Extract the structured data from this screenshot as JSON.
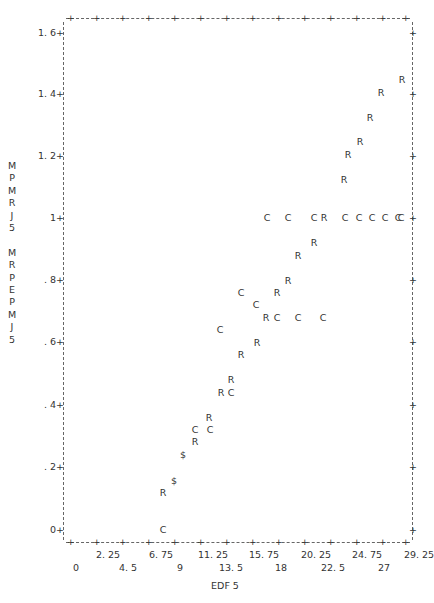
{
  "chart_data": {
    "type": "scatter",
    "title": "",
    "xlabel": "EDF 5",
    "ylabel": "MPMRJ5 MRPEPMJ5",
    "ylabel_lines": [
      "M",
      "P",
      "M",
      "R",
      "J",
      "5",
      "",
      "M",
      "R",
      "P",
      "E",
      "P",
      "M",
      "J",
      "5"
    ],
    "xlim": [
      0,
      29.25
    ],
    "ylim": [
      0,
      1.6
    ],
    "grid": false,
    "legend": null,
    "x_ticks_upper": [
      "2.25",
      "6.75",
      "11.25",
      "15.75",
      "20.25",
      "24.75",
      "29.25"
    ],
    "x_ticks_lower": [
      "0",
      "4.5",
      "9",
      "13.5",
      "18",
      "22.5",
      "27"
    ],
    "y_ticks": [
      "0+",
      ".2+",
      ".4+",
      ".6+",
      ".8+",
      "1+",
      "1.2+",
      "1.4+",
      "1.6+"
    ],
    "series": [
      {
        "name": "R",
        "symbol": "R",
        "points": [
          [
            29.0,
            1.45
          ],
          [
            27.2,
            1.41
          ],
          [
            26.2,
            1.33
          ],
          [
            25.4,
            1.25
          ],
          [
            24.3,
            1.21
          ],
          [
            23.9,
            1.13
          ],
          [
            19.7,
            1.0
          ],
          [
            21.2,
            0.92
          ],
          [
            19.9,
            0.88
          ],
          [
            18.9,
            0.8
          ],
          [
            17.9,
            0.76
          ],
          [
            17.1,
            0.68
          ],
          [
            16.3,
            0.6
          ],
          [
            14.9,
            0.56
          ],
          [
            14.0,
            0.48
          ],
          [
            13.2,
            0.44
          ],
          [
            12.1,
            0.36
          ],
          [
            11.0,
            0.28
          ],
          [
            8.1,
            0.12
          ]
        ]
      },
      {
        "name": "C",
        "symbol": "C",
        "points": [
          [
            17.3,
            1.0
          ],
          [
            19.0,
            1.0
          ],
          [
            21.3,
            1.0
          ],
          [
            24.0,
            1.0
          ],
          [
            25.2,
            1.0
          ],
          [
            26.3,
            1.0
          ],
          [
            27.5,
            1.0
          ],
          [
            28.6,
            1.0
          ],
          [
            29.2,
            1.0
          ],
          [
            14.9,
            0.76
          ],
          [
            16.2,
            0.72
          ],
          [
            18.0,
            0.68
          ],
          [
            19.8,
            0.68
          ],
          [
            22.1,
            0.68
          ],
          [
            13.1,
            0.64
          ],
          [
            14.0,
            0.44
          ],
          [
            11.0,
            0.32
          ],
          [
            12.2,
            0.32
          ],
          [
            8.1,
            0.0
          ]
        ]
      },
      {
        "name": "$ (overlap)",
        "symbol": "$",
        "points": [
          [
            9.9,
            0.24
          ],
          [
            9.1,
            0.16
          ]
        ]
      }
    ]
  },
  "plot": {
    "x_tick_labels_upper": [
      {
        "label": "2. 25",
        "px": 108
      },
      {
        "label": "6. 75",
        "px": 161
      },
      {
        "label": "11. 25",
        "px": 213
      },
      {
        "label": "15. 75",
        "px": 264
      },
      {
        "label": "20. 25",
        "px": 316
      },
      {
        "label": "24. 75",
        "px": 367
      },
      {
        "label": "29. 25",
        "px": 419
      }
    ],
    "x_tick_labels_lower": [
      {
        "label": "0",
        "px": 76
      },
      {
        "label": "4. 5",
        "px": 128
      },
      {
        "label": "9",
        "px": 180
      },
      {
        "label": "13. 5",
        "px": 231
      },
      {
        "label": "18",
        "px": 281
      },
      {
        "label": "22. 5",
        "px": 333
      },
      {
        "label": "27",
        "px": 384
      }
    ],
    "y_tick_labels": [
      {
        "label": "1. 6+",
        "py": 33
      },
      {
        "label": "1. 4+",
        "py": 94
      },
      {
        "label": "1. 2+",
        "py": 156
      },
      {
        "label": "1+",
        "py": 218
      },
      {
        "label": ". 8+",
        "py": 280
      },
      {
        "label": ". 6+",
        "py": 342
      },
      {
        "label": ". 4+",
        "py": 405
      },
      {
        "label": ". 2+",
        "py": 467
      },
      {
        "label": "0+",
        "py": 530
      }
    ],
    "markers": [
      {
        "s": "R",
        "x": 402,
        "y": 80
      },
      {
        "s": "R",
        "x": 381,
        "y": 93
      },
      {
        "s": "R",
        "x": 370,
        "y": 118
      },
      {
        "s": "R",
        "x": 360,
        "y": 142
      },
      {
        "s": "R",
        "x": 348,
        "y": 155
      },
      {
        "s": "R",
        "x": 344,
        "y": 180
      },
      {
        "s": "C",
        "x": 267,
        "y": 218
      },
      {
        "s": "C",
        "x": 288,
        "y": 218
      },
      {
        "s": "C",
        "x": 314,
        "y": 218
      },
      {
        "s": "R",
        "x": 324,
        "y": 218
      },
      {
        "s": "C",
        "x": 345,
        "y": 218
      },
      {
        "s": "C",
        "x": 359,
        "y": 218
      },
      {
        "s": "C",
        "x": 372,
        "y": 218
      },
      {
        "s": "C",
        "x": 385,
        "y": 218
      },
      {
        "s": "C",
        "x": 398,
        "y": 218
      },
      {
        "s": "C",
        "x": 401,
        "y": 218
      },
      {
        "s": "R",
        "x": 314,
        "y": 243
      },
      {
        "s": "R",
        "x": 298,
        "y": 256
      },
      {
        "s": "R",
        "x": 288,
        "y": 281
      },
      {
        "s": "R",
        "x": 277,
        "y": 293
      },
      {
        "s": "C",
        "x": 241,
        "y": 293
      },
      {
        "s": "C",
        "x": 256,
        "y": 305
      },
      {
        "s": "R",
        "x": 266,
        "y": 318
      },
      {
        "s": "C",
        "x": 277,
        "y": 318
      },
      {
        "s": "C",
        "x": 298,
        "y": 318
      },
      {
        "s": "C",
        "x": 323,
        "y": 318
      },
      {
        "s": "C",
        "x": 220,
        "y": 330
      },
      {
        "s": "R",
        "x": 257,
        "y": 343
      },
      {
        "s": "R",
        "x": 241,
        "y": 355
      },
      {
        "s": "R",
        "x": 231,
        "y": 380
      },
      {
        "s": "R",
        "x": 221,
        "y": 393
      },
      {
        "s": "C",
        "x": 231,
        "y": 393
      },
      {
        "s": "R",
        "x": 209,
        "y": 418
      },
      {
        "s": "C",
        "x": 195,
        "y": 430
      },
      {
        "s": "C",
        "x": 210,
        "y": 430
      },
      {
        "s": "R",
        "x": 195,
        "y": 442
      },
      {
        "s": "$",
        "x": 183,
        "y": 455
      },
      {
        "s": "$",
        "x": 174,
        "y": 481
      },
      {
        "s": "R",
        "x": 163,
        "y": 493
      },
      {
        "s": "C",
        "x": 163,
        "y": 530
      }
    ]
  }
}
